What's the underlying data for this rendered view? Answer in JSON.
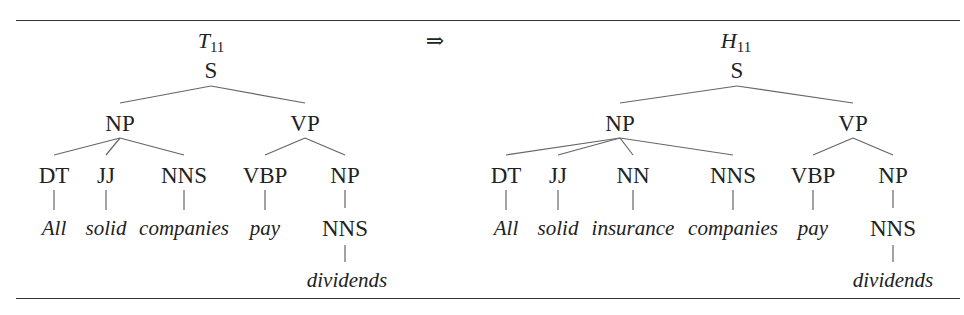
{
  "figure": {
    "arrow": "⇒",
    "left_tree": {
      "title_letter": "T",
      "title_sub": "11",
      "nodes": {
        "S": "S",
        "NP": "NP",
        "VP": "VP",
        "DT": "DT",
        "JJ": "JJ",
        "NNS": "NNS",
        "VBP": "VBP",
        "NP2": "NP",
        "NNS2": "NNS"
      },
      "words": [
        "All",
        "solid",
        "companies",
        "pay",
        "dividends"
      ]
    },
    "right_tree": {
      "title_letter": "H",
      "title_sub": "11",
      "nodes": {
        "S": "S",
        "NP": "NP",
        "VP": "VP",
        "DT": "DT",
        "JJ": "JJ",
        "NN": "NN",
        "NNS": "NNS",
        "VBP": "VBP",
        "NP2": "NP",
        "NNS2": "NNS"
      },
      "words": [
        "All",
        "solid",
        "insurance",
        "companies",
        "pay",
        "dividends"
      ]
    }
  }
}
